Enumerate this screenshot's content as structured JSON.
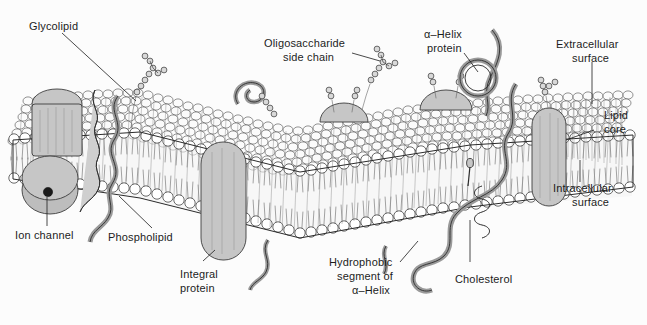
{
  "figure": {
    "background_color": "#fcfcfc",
    "ink_color": "#2b2b2b",
    "protein_fill_color": "#c6c6c6",
    "head_fill_color": "#ffffff",
    "label_color": "#1c1c1c"
  },
  "labels": {
    "glycolipid": "Glycolipid",
    "oligosaccharide_line1": "Oligosaccharide",
    "oligosaccharide_line2": "side chain",
    "alpha_helix_protein_line1": "α–Helix",
    "alpha_helix_protein_line2": "protein",
    "extracellular_line1": "Extracellular",
    "extracellular_line2": "surface",
    "lipid_core_line1": "Lipid",
    "lipid_core_line2": "core",
    "intracellular_line1": "Intracellular",
    "intracellular_line2": "surface",
    "ion_channel": "Ion channel",
    "phospholipid": "Phospholipid",
    "integral_protein_line1": "Integral",
    "integral_protein_line2": "protein",
    "hydrophobic_line1": "Hydrophobic",
    "hydrophobic_line2": "segment of",
    "hydrophobic_line3": "α–Helix",
    "cholesterol": "Cholesterol"
  }
}
